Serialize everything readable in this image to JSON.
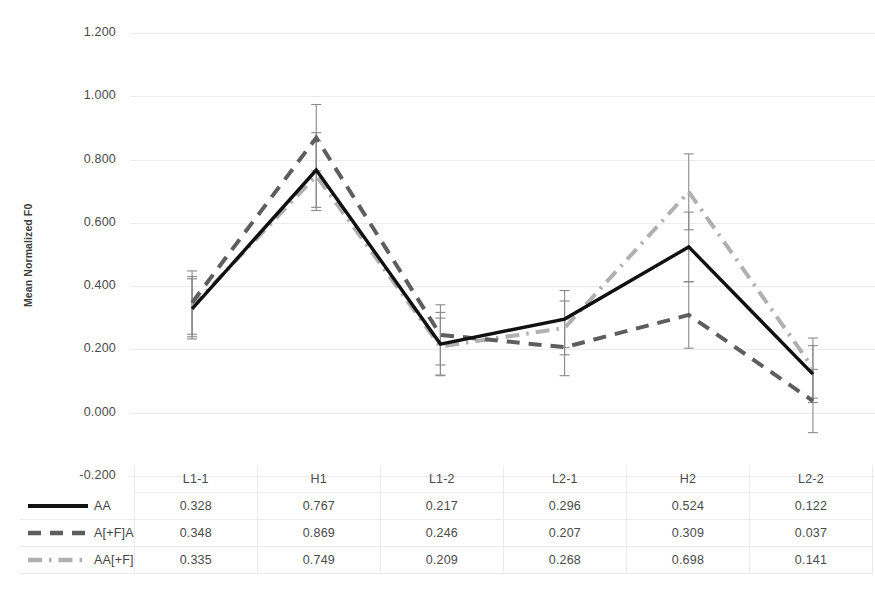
{
  "chart_data": {
    "type": "line",
    "title": "",
    "xlabel": "",
    "ylabel": "Mean Normalized F0",
    "categories": [
      "L1-1",
      "H1",
      "L1-2",
      "L2-1",
      "H2",
      "L2-2"
    ],
    "ylim": [
      -0.2,
      1.2
    ],
    "ytick_labels": [
      "1.200",
      "1.000",
      "0.800",
      "0.600",
      "0.400",
      "0.200",
      "0.000",
      "-0.200"
    ],
    "ytick_values": [
      1.2,
      1.0,
      0.8,
      0.6,
      0.4,
      0.2,
      0.0,
      -0.2
    ],
    "grid": true,
    "legend_position": "table-left",
    "has_error_bars": true,
    "series": [
      {
        "name": "AA",
        "style": "solid",
        "color": "#111111",
        "values": [
          0.328,
          0.767,
          0.217,
          0.296,
          0.524,
          0.122
        ],
        "error": [
          0.095,
          0.118,
          0.1,
          0.09,
          0.11,
          0.09
        ]
      },
      {
        "name": "A[+F]A",
        "style": "dashed",
        "color": "#5e5e5e",
        "values": [
          0.348,
          0.869,
          0.246,
          0.207,
          0.309,
          0.037
        ],
        "error": [
          0.1,
          0.105,
          0.095,
          0.09,
          0.105,
          0.1
        ]
      },
      {
        "name": "AA[+F]",
        "style": "dashdot",
        "color": "#b0b0b0",
        "values": [
          0.335,
          0.749,
          0.209,
          0.268,
          0.698,
          0.141
        ],
        "error": [
          0.095,
          0.11,
          0.09,
          0.085,
          0.12,
          0.095
        ]
      }
    ]
  },
  "table": {
    "header": [
      "",
      "L1-1",
      "H1",
      "L1-2",
      "L2-1",
      "H2",
      "L2-2"
    ],
    "rows": [
      {
        "label": "AA",
        "values": [
          "0.328",
          "0.767",
          "0.217",
          "0.296",
          "0.524",
          "0.122"
        ]
      },
      {
        "label": "A[+F]A",
        "values": [
          "0.348",
          "0.869",
          "0.246",
          "0.207",
          "0.309",
          "0.037"
        ]
      },
      {
        "label": "AA[+F]",
        "values": [
          "0.335",
          "0.749",
          "0.209",
          "0.268",
          "0.698",
          "0.141"
        ]
      }
    ]
  },
  "colors": {
    "series_aa": "#111111",
    "series_afa": "#5e5e5e",
    "series_aaf": "#b0b0b0",
    "gridline": "#eceaea",
    "text": "#4a4a4a"
  }
}
